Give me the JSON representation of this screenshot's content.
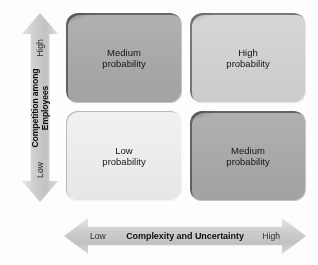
{
  "figure": {
    "type": "2x2-matrix",
    "background_color": "#ffffff"
  },
  "y_axis": {
    "label": "Competition among",
    "label_line2": "Employees",
    "high_label": "High",
    "low_label": "Low",
    "direction": "bidirectional-vertical",
    "fill_color": "#c9c9c9"
  },
  "x_axis": {
    "label": "Complexity and Uncertainty",
    "high_label": "High",
    "low_label": "Low",
    "direction": "bidirectional-horizontal",
    "fill_color": "#c9c9c9"
  },
  "quadrants": {
    "top_left": {
      "line1": "Medium",
      "line2": "probability",
      "shade": "medium",
      "fill_color": "#a9a9a9"
    },
    "top_right": {
      "line1": "High",
      "line2": "probability",
      "shade": "light",
      "fill_color": "#d1d1d1"
    },
    "bottom_left": {
      "line1": "Low",
      "line2": "probability",
      "shade": "pale",
      "fill_color": "#ededed"
    },
    "bottom_right": {
      "line1": "Medium",
      "line2": "probability",
      "shade": "medium",
      "fill_color": "#a9a9a9"
    }
  },
  "chart_data": {
    "type": "heatmap",
    "title": "",
    "xlabel": "Complexity and Uncertainty",
    "ylabel": "Competition among Employees",
    "x_categories": [
      "Low",
      "High"
    ],
    "y_categories": [
      "Low",
      "High"
    ],
    "cells": [
      {
        "x": "Low",
        "y": "High",
        "value": "Medium probability",
        "level": 2
      },
      {
        "x": "High",
        "y": "High",
        "value": "High probability",
        "level": 3
      },
      {
        "x": "Low",
        "y": "Low",
        "value": "Low probability",
        "level": 1
      },
      {
        "x": "High",
        "y": "Low",
        "value": "Medium probability",
        "level": 2
      }
    ],
    "grid": false,
    "legend": "none"
  }
}
